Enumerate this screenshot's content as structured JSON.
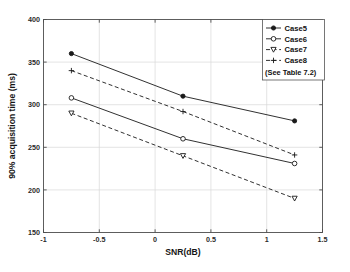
{
  "chart_data": {
    "type": "line",
    "title": "",
    "xlabel": "SNR(dB)",
    "ylabel": "90% acquisition time (ms)",
    "xlim": [
      -1,
      1.5
    ],
    "ylim": [
      150,
      400
    ],
    "xticks": [
      -1,
      -0.5,
      0,
      0.5,
      1,
      1.5
    ],
    "xticklabels": [
      "-1",
      "-0.5",
      "0",
      "0.5",
      "1",
      "1.5"
    ],
    "yticks": [
      150,
      200,
      250,
      300,
      350,
      400
    ],
    "yticklabels": [
      "150",
      "200",
      "250",
      "300",
      "350",
      "400"
    ],
    "grid": true,
    "legend_position": "top-right",
    "legend_note": "(See Table 7.2)",
    "x": [
      -0.75,
      0.25,
      1.25
    ],
    "series": [
      {
        "name": "Case5",
        "values": [
          360,
          310,
          281
        ],
        "linestyle": "solid",
        "marker": "filled-circle"
      },
      {
        "name": "Case6",
        "values": [
          308,
          260,
          231
        ],
        "linestyle": "solid",
        "marker": "open-circle"
      },
      {
        "name": "Case7",
        "values": [
          290,
          240,
          190
        ],
        "linestyle": "dashed",
        "marker": "triangle-down"
      },
      {
        "name": "Case8",
        "values": [
          340,
          292,
          241
        ],
        "linestyle": "dashed",
        "marker": "plus"
      }
    ]
  },
  "colors": {
    "background": "#ffffff",
    "axis": "#4d4d4d",
    "grid": "#d8d8d8",
    "ink": "#1a1a1a"
  }
}
